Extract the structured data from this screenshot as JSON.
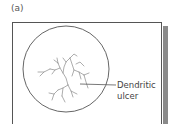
{
  "figure": {
    "panel_label": "(a)",
    "annotation": {
      "line1": "Dendritic",
      "line2": "ulcer"
    },
    "colors": {
      "stroke": "#555555",
      "shadow": "#8a8a8a",
      "background": "#ffffff"
    }
  }
}
